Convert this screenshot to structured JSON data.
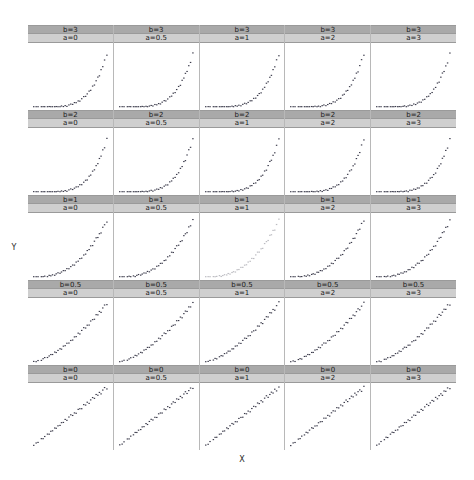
{
  "figure": {
    "type": "lattice-scatter-matrix",
    "xlabel": "X",
    "ylabel": "Y",
    "strip_color_b": "#a9a9a9",
    "strip_color_a": "#cfcfcf",
    "point_color": "#3a3a4a",
    "background": "#ffffff",
    "rows_label": "b",
    "cols_label": "a"
  },
  "chart_data": {
    "type": "scatter",
    "title": "",
    "xlabel": "X",
    "ylabel": "Y",
    "grid": false,
    "legend": null,
    "layout": {
      "rows": 5,
      "cols": 5
    },
    "row_values": [
      3,
      2,
      1,
      0.5,
      0
    ],
    "col_values": [
      0,
      0.5,
      1,
      2,
      3
    ],
    "row_labels": [
      "b=3",
      "b=2",
      "b=1",
      "b=0.5",
      "b=0"
    ],
    "col_labels": [
      "a=0",
      "a=0.5",
      "a=1",
      "a=2",
      "a=3"
    ],
    "xlim": [
      0,
      1
    ],
    "ylim": [
      0,
      1
    ],
    "faded_panel": {
      "row": 2,
      "col": 2
    },
    "x": [
      0.03,
      0.061,
      0.085,
      0.128,
      0.15,
      0.171,
      0.206,
      0.228,
      0.249,
      0.271,
      0.299,
      0.318,
      0.341,
      0.367,
      0.386,
      0.41,
      0.433,
      0.455,
      0.481,
      0.505,
      0.529,
      0.552,
      0.574,
      0.6,
      0.621,
      0.645,
      0.671,
      0.695,
      0.716,
      0.74,
      0.76,
      0.785,
      0.808,
      0.83,
      0.852,
      0.872,
      0.893,
      0.915,
      0.938,
      0.968
    ],
    "jitter_y": [
      0.012,
      -0.018,
      0.021,
      -0.009,
      0.028,
      -0.024,
      0.014,
      0.03,
      -0.016,
      0.008,
      -0.027,
      0.019,
      0.006,
      -0.022,
      0.025,
      -0.011,
      0.017,
      -0.029,
      0.01,
      0.023,
      -0.014,
      0.027,
      -0.007,
      0.018,
      -0.025,
      0.013,
      0.029,
      -0.019,
      0.005,
      0.022,
      -0.012,
      0.026,
      -0.021,
      0.009,
      0.016,
      -0.028,
      0.02,
      -0.006,
      0.024,
      -0.015
    ],
    "panels": [
      {
        "row": 0,
        "col": 0,
        "b": 3,
        "a": 0,
        "strip_b": "b=3",
        "strip_a": "a=0",
        "curve": "exponential"
      },
      {
        "row": 0,
        "col": 1,
        "b": 3,
        "a": 0.5,
        "strip_b": "b=3",
        "strip_a": "a=0.5",
        "curve": "exponential"
      },
      {
        "row": 0,
        "col": 2,
        "b": 3,
        "a": 1,
        "strip_b": "b=3",
        "strip_a": "a=1",
        "curve": "exponential"
      },
      {
        "row": 0,
        "col": 3,
        "b": 3,
        "a": 2,
        "strip_b": "b=3",
        "strip_a": "a=2",
        "curve": "exponential"
      },
      {
        "row": 0,
        "col": 4,
        "b": 3,
        "a": 3,
        "strip_b": "b=3",
        "strip_a": "a=3",
        "curve": "exponential"
      },
      {
        "row": 1,
        "col": 0,
        "b": 2,
        "a": 0,
        "strip_b": "b=2",
        "strip_a": "a=0",
        "curve": "exponential"
      },
      {
        "row": 1,
        "col": 1,
        "b": 2,
        "a": 0.5,
        "strip_b": "b=2",
        "strip_a": "a=0.5",
        "curve": "exponential"
      },
      {
        "row": 1,
        "col": 2,
        "b": 2,
        "a": 1,
        "strip_b": "b=2",
        "strip_a": "a=1",
        "curve": "exponential"
      },
      {
        "row": 1,
        "col": 3,
        "b": 2,
        "a": 2,
        "strip_b": "b=2",
        "strip_a": "a=2",
        "curve": "exponential"
      },
      {
        "row": 1,
        "col": 4,
        "b": 2,
        "a": 3,
        "strip_b": "b=2",
        "strip_a": "a=3",
        "curve": "exponential"
      },
      {
        "row": 2,
        "col": 0,
        "b": 1,
        "a": 0,
        "strip_b": "b=1",
        "strip_a": "a=0",
        "curve": "power"
      },
      {
        "row": 2,
        "col": 1,
        "b": 1,
        "a": 0.5,
        "strip_b": "b=1",
        "strip_a": "a=0.5",
        "curve": "power"
      },
      {
        "row": 2,
        "col": 2,
        "b": 1,
        "a": 1,
        "strip_b": "b=1",
        "strip_a": "a=1",
        "curve": "power",
        "faded": true
      },
      {
        "row": 2,
        "col": 3,
        "b": 1,
        "a": 2,
        "strip_b": "b=1",
        "strip_a": "a=2",
        "curve": "power"
      },
      {
        "row": 2,
        "col": 4,
        "b": 1,
        "a": 3,
        "strip_b": "b=1",
        "strip_a": "a=3",
        "curve": "power"
      },
      {
        "row": 3,
        "col": 0,
        "b": 0.5,
        "a": 0,
        "strip_b": "b=0.5",
        "strip_a": "a=0",
        "curve": "mild"
      },
      {
        "row": 3,
        "col": 1,
        "b": 0.5,
        "a": 0.5,
        "strip_b": "b=0.5",
        "strip_a": "a=0.5",
        "curve": "mild"
      },
      {
        "row": 3,
        "col": 2,
        "b": 0.5,
        "a": 1,
        "strip_b": "b=0.5",
        "strip_a": "a=1",
        "curve": "mild"
      },
      {
        "row": 3,
        "col": 3,
        "b": 0.5,
        "a": 2,
        "strip_b": "b=0.5",
        "strip_a": "a=2",
        "curve": "mild"
      },
      {
        "row": 3,
        "col": 4,
        "b": 0.5,
        "a": 3,
        "strip_b": "b=0.5",
        "strip_a": "a=3",
        "curve": "mild"
      },
      {
        "row": 4,
        "col": 0,
        "b": 0,
        "a": 0,
        "strip_b": "b=0",
        "strip_a": "a=0",
        "curve": "linear"
      },
      {
        "row": 4,
        "col": 1,
        "b": 0,
        "a": 0.5,
        "strip_b": "b=0",
        "strip_a": "a=0.5",
        "curve": "linear"
      },
      {
        "row": 4,
        "col": 2,
        "b": 0,
        "a": 1,
        "strip_b": "b=0",
        "strip_a": "a=1",
        "curve": "linear"
      },
      {
        "row": 4,
        "col": 3,
        "b": 0,
        "a": 2,
        "strip_b": "b=0",
        "strip_a": "a=2",
        "curve": "linear"
      },
      {
        "row": 4,
        "col": 4,
        "b": 0,
        "a": 3,
        "strip_b": "b=0",
        "strip_a": "a=3",
        "curve": "linear"
      }
    ]
  }
}
